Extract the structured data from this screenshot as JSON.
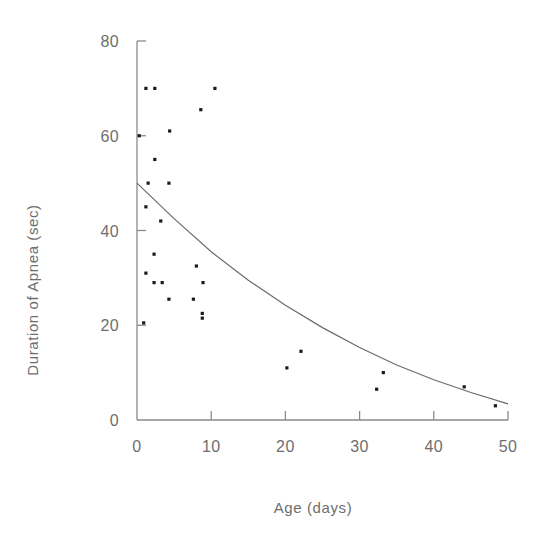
{
  "chart_data": {
    "type": "scatter",
    "title": "",
    "xlabel": "Age (days)",
    "ylabel": "Duration of Apnea (sec)",
    "xlim": [
      0,
      50
    ],
    "ylim": [
      0,
      80
    ],
    "xticks": [
      0,
      10,
      20,
      30,
      40,
      50
    ],
    "xtick_labels": [
      "0",
      "10",
      "20",
      "30",
      "40",
      "50"
    ],
    "yticks": [
      0,
      20,
      40,
      60,
      80
    ],
    "ytick_labels": [
      "0",
      "20",
      "40",
      "60",
      "80"
    ],
    "grid": false,
    "legend": false,
    "marker": "square",
    "marker_color": "#1a1a1a",
    "axis_color": "#8a8a8a",
    "curve_color": "#6b6b6b",
    "points": [
      {
        "x": 1.2,
        "y": 70
      },
      {
        "x": 2.4,
        "y": 70
      },
      {
        "x": 10.5,
        "y": 70
      },
      {
        "x": 8.6,
        "y": 65.5
      },
      {
        "x": 4.4,
        "y": 61
      },
      {
        "x": 0.3,
        "y": 60
      },
      {
        "x": 2.4,
        "y": 55
      },
      {
        "x": 1.5,
        "y": 50
      },
      {
        "x": 4.3,
        "y": 50
      },
      {
        "x": 1.2,
        "y": 45
      },
      {
        "x": 3.2,
        "y": 42
      },
      {
        "x": 2.3,
        "y": 35
      },
      {
        "x": 8.0,
        "y": 32.5
      },
      {
        "x": 1.2,
        "y": 31
      },
      {
        "x": 2.3,
        "y": 29
      },
      {
        "x": 3.4,
        "y": 29
      },
      {
        "x": 8.9,
        "y": 29
      },
      {
        "x": 4.3,
        "y": 25.5
      },
      {
        "x": 7.6,
        "y": 25.5
      },
      {
        "x": 8.8,
        "y": 22.5
      },
      {
        "x": 8.8,
        "y": 21.5
      },
      {
        "x": 0.9,
        "y": 20.5
      },
      {
        "x": 20.2,
        "y": 11
      },
      {
        "x": 22.1,
        "y": 14.5
      },
      {
        "x": 33.2,
        "y": 10
      },
      {
        "x": 32.3,
        "y": 6.5
      },
      {
        "x": 44.1,
        "y": 7
      },
      {
        "x": 48.3,
        "y": 3
      }
    ],
    "curve": {
      "description": "exponential decay fit",
      "y0": 50,
      "decay_points": [
        {
          "x": 0,
          "y": 50
        },
        {
          "x": 5,
          "y": 42.5
        },
        {
          "x": 10,
          "y": 35.5
        },
        {
          "x": 15,
          "y": 29.5
        },
        {
          "x": 20,
          "y": 24.2
        },
        {
          "x": 25,
          "y": 19.5
        },
        {
          "x": 30,
          "y": 15.3
        },
        {
          "x": 35,
          "y": 11.6
        },
        {
          "x": 40,
          "y": 8.5
        },
        {
          "x": 45,
          "y": 5.8
        },
        {
          "x": 50,
          "y": 3.4
        }
      ]
    }
  }
}
